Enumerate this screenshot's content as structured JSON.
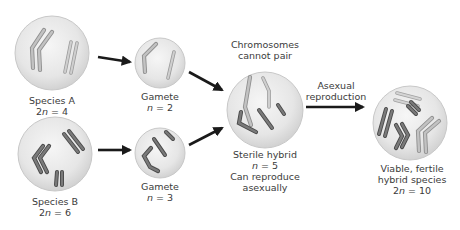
{
  "colors": {
    "cell_fill_center": "#f2f2f2",
    "cell_fill_edge": "#d6d6d6",
    "cell_stroke": "#c4c4c4",
    "chrom_light": "#b9b9b9",
    "chrom_light_edge": "#8e8e8e",
    "chrom_dark": "#6e6e6e",
    "chrom_dark_edge": "#444444",
    "arrow": "#1a1a1a",
    "text": "#3b3b3b"
  },
  "cells": {
    "species_a": {
      "name": "Species A",
      "ploidy_prefix": "2",
      "ploidy_var": "n",
      "ploidy_value": " = 4"
    },
    "species_b": {
      "name": "Species B",
      "ploidy_prefix": "2",
      "ploidy_var": "n",
      "ploidy_value": " = 6"
    },
    "gamete_a": {
      "name": "Gamete",
      "ploidy_prefix": "",
      "ploidy_var": "n",
      "ploidy_value": " = 2"
    },
    "gamete_b": {
      "name": "Gamete",
      "ploidy_prefix": "",
      "ploidy_var": "n",
      "ploidy_value": " = 3"
    },
    "sterile_hybrid": {
      "top_note_line1": "Chromosomes",
      "top_note_line2": "cannot pair",
      "name": "Sterile hybrid",
      "ploidy_prefix": "",
      "ploidy_var": "n",
      "ploidy_value": " = 5",
      "note_line1": "Can reproduce",
      "note_line2": "asexually"
    },
    "fertile_hybrid": {
      "name_line1": "Viable, fertile",
      "name_line2": "hybrid species",
      "ploidy_prefix": "2",
      "ploidy_var": "n",
      "ploidy_value": " = 10"
    }
  },
  "arrows": {
    "asexual_label_line1": "Asexual",
    "asexual_label_line2": "reproduction"
  }
}
